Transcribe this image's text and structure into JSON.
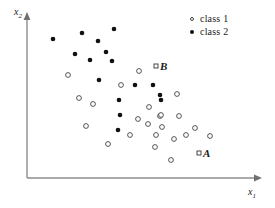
{
  "figure": {
    "title": "",
    "background_color": "#ffffff"
  },
  "axes": {
    "x_label": "x",
    "x_label_sub": "1",
    "y_label": "x",
    "y_label_sub": "2",
    "axis_color": "#888888",
    "origin_px": [
      27,
      178
    ],
    "x_axis_end_px": [
      262,
      178
    ],
    "y_axis_end_px": [
      27,
      14
    ]
  },
  "legend": {
    "position": "top-right",
    "entries": [
      {
        "label": "class 1",
        "marker": "open-circle",
        "color": "#444444"
      },
      {
        "label": "class 2",
        "marker": "filled-circle",
        "color": "#111111"
      }
    ]
  },
  "annotations": [
    {
      "name": "B",
      "label": "B",
      "marker": "open-square",
      "x_px": 156,
      "y_px": 66
    },
    {
      "name": "A",
      "label": "A",
      "marker": "open-square",
      "x_px": 199,
      "y_px": 153
    }
  ],
  "chart_data": {
    "type": "scatter",
    "title": "",
    "xlabel": "x1",
    "ylabel": "x2",
    "grid": false,
    "legend_position": "top-right",
    "axis_style": "arrowed-L-axes-no-ticks",
    "xlim_px": [
      27,
      262
    ],
    "ylim_px": [
      178,
      14
    ],
    "series": [
      {
        "name": "class 1",
        "marker": "open-circle",
        "color": "#444444",
        "points_px": [
          [
            68,
            75
          ],
          [
            79,
            98
          ],
          [
            121,
            85
          ],
          [
            139,
            71
          ],
          [
            93,
            104
          ],
          [
            86,
            126
          ],
          [
            108,
            144
          ],
          [
            130,
            135
          ],
          [
            138,
            119
          ],
          [
            148,
            124
          ],
          [
            149,
            107
          ],
          [
            156,
            135
          ],
          [
            160,
            116
          ],
          [
            161,
            115
          ],
          [
            162,
            127
          ],
          [
            155,
            147
          ],
          [
            171,
            160
          ],
          [
            174,
            139
          ],
          [
            177,
            94
          ],
          [
            179,
            116
          ],
          [
            186,
            135
          ],
          [
            195,
            128
          ],
          [
            210,
            136
          ]
        ]
      },
      {
        "name": "class 2",
        "marker": "filled-circle",
        "color": "#111111",
        "points_px": [
          [
            53,
            39
          ],
          [
            82,
            33
          ],
          [
            114,
            29
          ],
          [
            98,
            41
          ],
          [
            75,
            54
          ],
          [
            106,
            52
          ],
          [
            90,
            60
          ],
          [
            112,
            61
          ],
          [
            99,
            80
          ],
          [
            119,
            100
          ],
          [
            135,
            85
          ],
          [
            153,
            85
          ],
          [
            160,
            95
          ],
          [
            120,
            115
          ],
          [
            161,
            100
          ],
          [
            118,
            130
          ]
        ]
      }
    ]
  }
}
